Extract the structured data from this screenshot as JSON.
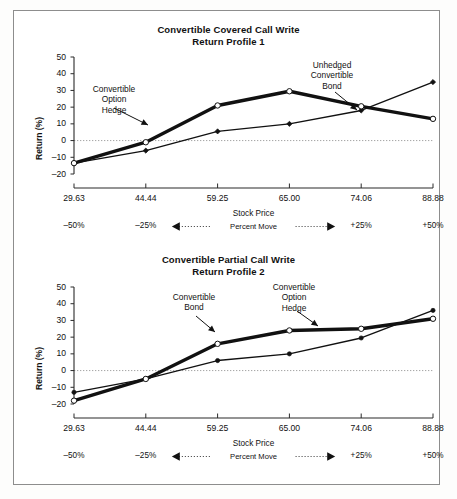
{
  "document": {
    "background_color": "#ffffff",
    "border_color": "#8d8d8d"
  },
  "axis": {
    "ylabel": "Return (%)",
    "xlabel": "Stock Price",
    "percent_move_label": "Percent Move",
    "yticks": [
      "50",
      "40",
      "30",
      "20",
      "10",
      "0",
      "–10",
      "–20"
    ],
    "xticks": [
      "29.63",
      "44.44",
      "59.25",
      "65.00",
      "74.06",
      "88.88"
    ],
    "percent_moves": [
      "–50%",
      "–25%",
      "",
      "",
      "+25%",
      "+50%"
    ]
  },
  "panels": [
    {
      "title_line1": "Convertible Covered Call Write",
      "title_line2": "Return Profile 1",
      "annotations": [
        {
          "name": "hedge",
          "lines": [
            "Convertible",
            "Option",
            "Hedge"
          ]
        },
        {
          "name": "bond",
          "lines": [
            "Unhedged",
            "Convertible",
            "Bond"
          ]
        }
      ]
    },
    {
      "title_line1": "Convertible Partial Call Write",
      "title_line2": "Return Profile 2",
      "annotations": [
        {
          "name": "bond",
          "lines": [
            "Convertible",
            "Bond"
          ]
        },
        {
          "name": "hedge",
          "lines": [
            "Convertible",
            "Option",
            "Hedge"
          ]
        }
      ]
    }
  ],
  "chart_data": [
    {
      "type": "line",
      "title": "Convertible Covered Call Write Return Profile 1",
      "xlabel": "Stock Price",
      "ylabel": "Return (%)",
      "x": [
        "29.63",
        "44.44",
        "59.25",
        "65.00",
        "74.06",
        "88.88"
      ],
      "x_percent_move": [
        "-50%",
        "-25%",
        "",
        "",
        "+25%",
        "+50%"
      ],
      "ylim": [
        -20,
        50
      ],
      "ytick_step": 10,
      "grid": false,
      "zero_line": true,
      "legend": "in-plot annotations",
      "series": [
        {
          "name": "Convertible Option Hedge",
          "marker": "open-circle",
          "line_weight": "thick",
          "values": [
            -13.5,
            -1.0,
            21.0,
            29.5,
            20.5,
            13.0
          ]
        },
        {
          "name": "Unhedged Convertible Bond",
          "marker": "filled-diamond",
          "line_weight": "thin",
          "values": [
            -13.5,
            -6.0,
            5.5,
            10.0,
            18.0,
            35.0
          ]
        }
      ]
    },
    {
      "type": "line",
      "title": "Convertible Partial Call Write Return Profile 2",
      "xlabel": "Stock Price",
      "ylabel": "Return (%)",
      "x": [
        "29.63",
        "44.44",
        "59.25",
        "65.00",
        "74.06",
        "88.88"
      ],
      "x_percent_move": [
        "-50%",
        "-25%",
        "",
        "",
        "+25%",
        "+50%"
      ],
      "ylim": [
        -20,
        50
      ],
      "ytick_step": 10,
      "grid": false,
      "zero_line": true,
      "legend": "in-plot annotations",
      "series": [
        {
          "name": "Convertible Option Hedge",
          "marker": "open-circle",
          "line_weight": "thick",
          "values": [
            -18.0,
            -5.0,
            16.0,
            24.0,
            25.0,
            31.0
          ]
        },
        {
          "name": "Convertible Bond",
          "marker": "filled-circle",
          "line_weight": "thin",
          "values": [
            -13.0,
            -5.0,
            6.0,
            10.0,
            19.5,
            36.0
          ]
        }
      ]
    }
  ]
}
